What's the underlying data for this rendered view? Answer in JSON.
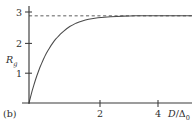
{
  "figure": {
    "panel_label": "(b)",
    "background_color": "#ffffff",
    "axis_color": "#3a3a3a",
    "curve_color": "#4a4a4a",
    "asymptote_color": "#555555"
  },
  "axes": {
    "y_label_main": "R",
    "y_label_sub": "g",
    "x_label_numerator": "D",
    "x_label_slash": "/",
    "x_label_denominator": "Δ",
    "x_label_denominator_sub": "0"
  },
  "chart_data": {
    "type": "line",
    "title": "",
    "xlabel": "D/Δ0",
    "ylabel": "Rg",
    "xlim": [
      0,
      5.2
    ],
    "ylim": [
      0,
      3.45
    ],
    "grid": false,
    "legend": null,
    "x_ticks": [
      2,
      4
    ],
    "x_tick_labels": [
      "2",
      "4"
    ],
    "y_ticks": [
      1,
      2,
      3
    ],
    "y_tick_labels": [
      "1",
      "2",
      "3"
    ],
    "annotations": [
      {
        "text": "(b)",
        "position": "bottom-left",
        "note": "panel identifier"
      }
    ],
    "series": [
      {
        "name": "Rg saturating curve",
        "style": "solid",
        "x": [
          0.0,
          0.05,
          0.1,
          0.15,
          0.2,
          0.25,
          0.3,
          0.35,
          0.4,
          0.45,
          0.5,
          0.55,
          0.6,
          0.65,
          0.7,
          0.75,
          0.8,
          0.85,
          0.9,
          0.95,
          1.0,
          1.1,
          1.2,
          1.3,
          1.4,
          1.5,
          1.6,
          1.7,
          1.8,
          1.9,
          2.0,
          2.2,
          2.4,
          2.6,
          2.8,
          3.0,
          3.2,
          3.4,
          3.6,
          3.8,
          4.0,
          4.3,
          4.6,
          4.9,
          5.2
        ],
        "y": [
          0.0,
          0.22,
          0.43,
          0.62,
          0.8,
          0.97,
          1.12,
          1.27,
          1.4,
          1.53,
          1.65,
          1.76,
          1.86,
          1.95,
          2.04,
          2.12,
          2.2,
          2.27,
          2.33,
          2.39,
          2.45,
          2.55,
          2.64,
          2.72,
          2.78,
          2.84,
          2.88,
          2.92,
          2.95,
          2.98,
          3.0,
          3.03,
          3.05,
          3.07,
          3.08,
          3.09,
          3.095,
          3.1,
          3.1,
          3.1,
          3.1,
          3.1,
          3.1,
          3.1,
          3.1
        ]
      }
    ],
    "asymptote": {
      "name": "saturation asymptote",
      "style": "dashed",
      "y_value": 3.1,
      "x_from": 0.0,
      "x_to": 5.2
    }
  }
}
